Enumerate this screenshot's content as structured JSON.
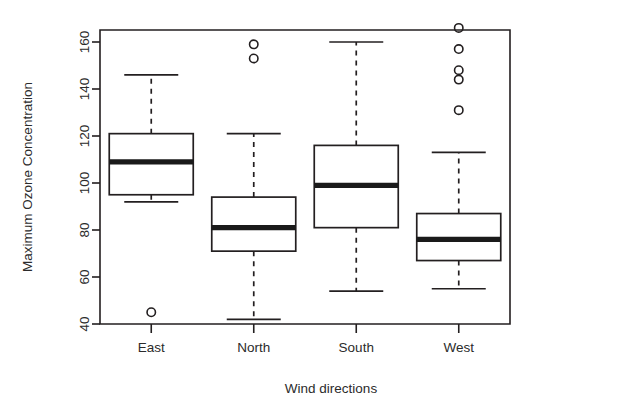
{
  "chart_data": {
    "type": "box",
    "title": "",
    "xlabel": "Wind directions",
    "ylabel": "Maximum Ozone Concentration",
    "categories": [
      "East",
      "North",
      "South",
      "West"
    ],
    "ylim": [
      36,
      170
    ],
    "yticks": [
      40,
      60,
      80,
      100,
      120,
      140,
      160
    ],
    "ytick_labels": [
      "40",
      "60",
      "80",
      "100",
      "120",
      "140",
      "160"
    ],
    "grid": false,
    "legend": null,
    "boxes": [
      {
        "category": "East",
        "whisker_low": 92,
        "q1": 95,
        "median": 109,
        "q3": 121,
        "whisker_high": 146,
        "outliers": [
          45
        ]
      },
      {
        "category": "North",
        "whisker_low": 42,
        "q1": 71,
        "median": 81,
        "q3": 94,
        "whisker_high": 121,
        "outliers": [
          159,
          153
        ]
      },
      {
        "category": "South",
        "whisker_low": 54,
        "q1": 81,
        "median": 99,
        "q3": 116,
        "whisker_high": 160,
        "outliers": []
      },
      {
        "category": "West",
        "whisker_low": 55,
        "q1": 67,
        "median": 76,
        "q3": 87,
        "whisker_high": 113,
        "outliers": [
          166,
          157,
          148,
          144,
          131
        ]
      }
    ]
  },
  "axis": {
    "x_label": "Wind directions",
    "y_label": "Maximum Ozone Concentration",
    "x_tick_labels": [
      "East",
      "North",
      "South",
      "West"
    ],
    "y_tick_labels": [
      "40",
      "60",
      "80",
      "100",
      "120",
      "140",
      "160"
    ]
  },
  "colors": {
    "stroke": "#231f20",
    "background": "#ffffff",
    "median": "#1a1a1a",
    "text": "#2b2b2b"
  }
}
